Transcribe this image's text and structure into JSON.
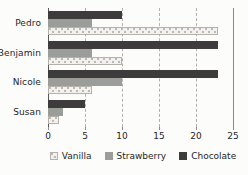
{
  "chart_data": {
    "type": "bar",
    "orientation": "horizontal",
    "title": "",
    "categories": [
      "Pedro",
      "Benjamin",
      "Nicole",
      "Susan"
    ],
    "series": [
      {
        "name": "Vanilla",
        "values": [
          23,
          10,
          6,
          1.5
        ],
        "color": "#f2f1ed",
        "pattern": "dots",
        "dot_color": "#bdbab2"
      },
      {
        "name": "Strawberry",
        "values": [
          6,
          6,
          10,
          2
        ],
        "color": "#9a9d98"
      },
      {
        "name": "Chocolate",
        "values": [
          10,
          23,
          23,
          5
        ],
        "color": "#3d3b3c"
      }
    ],
    "bar_render_order_top_to_bottom": [
      "Chocolate",
      "Strawberry",
      "Vanilla"
    ],
    "xlim": [
      0,
      25
    ],
    "x_ticks": [
      0,
      5,
      10,
      15,
      20,
      25
    ],
    "grid": "vertical-dashed",
    "legend_position": "bottom",
    "legend": [
      "Vanilla",
      "Strawberry",
      "Chocolate"
    ]
  },
  "styles": {
    "background": "#fcfcfb",
    "text_color": "#262626",
    "gridline_color": "#b3b1ad",
    "axis_line_color": "#5a5856",
    "end_line_color": "#8a8886"
  }
}
